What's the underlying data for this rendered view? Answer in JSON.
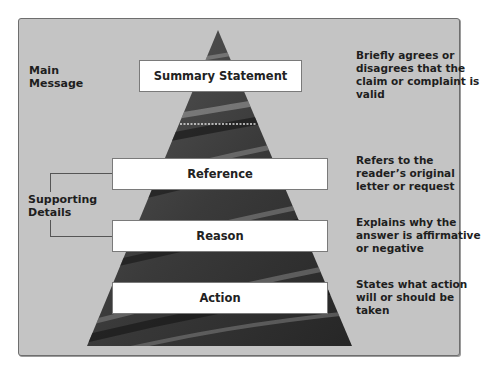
{
  "diagram": {
    "type": "pyramid",
    "left_labels": {
      "main_message": "Main\nMessage",
      "supporting_details": "Supporting\nDetails"
    },
    "levels": [
      {
        "label": "Summary Statement",
        "description": "Briefly agrees or disagrees that the claim or complaint is valid"
      },
      {
        "label": "Reference",
        "description": "Refers to the reader’s original letter or request"
      },
      {
        "label": "Reason",
        "description": "Explains why the answer is affirmative or negative"
      },
      {
        "label": "Action",
        "description": "States what action will or should be taken"
      }
    ],
    "colors": {
      "panel": "#c4c4c4",
      "pyramid_dark": "#2b2b2b",
      "pyramid_light": "#8a8a8a",
      "box": "#ffffff"
    }
  }
}
